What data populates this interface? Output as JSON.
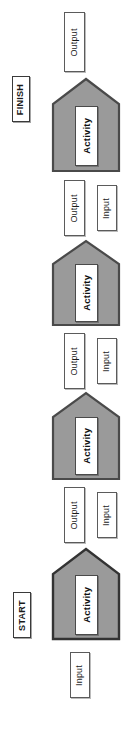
{
  "diagram": {
    "orientation": "rotated-90-ccw",
    "palette": {
      "activity_fill": "#9a9a9a",
      "activity_stroke": "#4a4a4a",
      "box_fill": "#ffffff",
      "box_stroke": "#5b5b5b",
      "text": "#111111",
      "background": "#ffffff"
    },
    "terminals": {
      "start": "START",
      "finish": "FINISH"
    },
    "labels": {
      "activity": "Activity",
      "input": "Input",
      "output": "Output"
    },
    "nodes": [
      {
        "id": "n1",
        "type": "io",
        "label": "Output"
      },
      {
        "id": "n2",
        "type": "terminal",
        "label": "FINISH"
      },
      {
        "id": "n3",
        "type": "activity",
        "label": "Activity"
      },
      {
        "id": "n4",
        "type": "io",
        "label": "Output"
      },
      {
        "id": "n5",
        "type": "io",
        "label": "Input"
      },
      {
        "id": "n6",
        "type": "activity",
        "label": "Activity"
      },
      {
        "id": "n7",
        "type": "io",
        "label": "Output"
      },
      {
        "id": "n8",
        "type": "io",
        "label": "Input"
      },
      {
        "id": "n9",
        "type": "activity",
        "label": "Activity"
      },
      {
        "id": "n10",
        "type": "io",
        "label": "Output"
      },
      {
        "id": "n11",
        "type": "io",
        "label": "Input"
      },
      {
        "id": "n12",
        "type": "terminal",
        "label": "START"
      },
      {
        "id": "n13",
        "type": "activity",
        "label": "Activity"
      },
      {
        "id": "n14",
        "type": "io",
        "label": "Input"
      }
    ]
  }
}
